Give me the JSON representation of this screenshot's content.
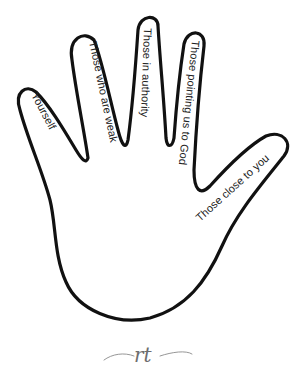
{
  "prayer_hand": {
    "fingers": [
      {
        "id": "pinky",
        "label": "Yourself"
      },
      {
        "id": "ring",
        "label": "Those who are weak"
      },
      {
        "id": "middle",
        "label": "Those in authority"
      },
      {
        "id": "index",
        "label": "Those pointing us to God"
      },
      {
        "id": "thumb",
        "label": "Those close to you"
      }
    ],
    "outline_color": "#111111",
    "text_color": "#222222"
  },
  "signature": {
    "monogram": "rt",
    "color": "#6e6e6e"
  }
}
